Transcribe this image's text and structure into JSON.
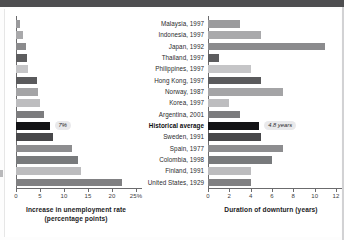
{
  "chart_data": [
    {
      "type": "bar",
      "orientation": "horizontal",
      "title": "",
      "xlabel": "Increase in unemployment rate (percentage points)",
      "ylabel": "",
      "xlim": [
        0,
        25
      ],
      "xticks": [
        0,
        5,
        10,
        15,
        20,
        25
      ],
      "xtick_labels": [
        "0",
        "5",
        "10",
        "15",
        "20",
        "25%"
      ],
      "grid": false,
      "categories": [
        "Malaysia, 1997",
        "Indonesia, 1997",
        "Japan, 1992",
        "Thailand, 1997",
        "Philippines, 1997",
        "Hong Kong, 1997",
        "Norway, 1987",
        "Korea, 1997",
        "Argentina, 2001",
        "Historical average",
        "Sweden, 1991",
        "Spain, 1977",
        "Colombia, 1998",
        "Finland, 1991",
        "United States, 1929"
      ],
      "values": [
        0.9,
        1.5,
        2.1,
        2.3,
        2.5,
        4.3,
        4.6,
        5.0,
        5.9,
        7.0,
        7.8,
        11.7,
        13.0,
        13.5,
        22.0
      ],
      "annotation": "7%",
      "annotation_index": 9
    },
    {
      "type": "bar",
      "orientation": "horizontal",
      "title": "",
      "xlabel": "Duration of downturn (years)",
      "ylabel": "",
      "xlim": [
        0,
        12
      ],
      "xticks": [
        0,
        2,
        4,
        6,
        8,
        10,
        12
      ],
      "xtick_labels": [
        "0",
        "2",
        "4",
        "6",
        "8",
        "10",
        "12"
      ],
      "grid": false,
      "categories": [
        "Malaysia, 1997",
        "Indonesia, 1997",
        "Japan, 1992",
        "Thailand, 1997",
        "Philippines, 1997",
        "Hong Kong, 1997",
        "Norway, 1987",
        "Korea, 1997",
        "Argentina, 2001",
        "Historical average",
        "Sweden, 1991",
        "Spain, 1977",
        "Colombia, 1998",
        "Finland, 1991",
        "United States, 1929"
      ],
      "values": [
        3.0,
        5.0,
        11.0,
        1.0,
        4.0,
        5.0,
        7.0,
        2.0,
        3.0,
        4.8,
        5.0,
        7.0,
        6.0,
        4.0,
        4.0
      ],
      "annotation": "4.8 years",
      "annotation_index": 9
    }
  ],
  "left_chart": {
    "axis_title_line1": "Increase in unemployment rate",
    "axis_title_line2": "(percentage points)",
    "tick_labels": [
      "0",
      "5",
      "10",
      "15",
      "20",
      "25%"
    ],
    "badge": "7%"
  },
  "right_chart": {
    "axis_title_line1": "Duration of downturn (years)",
    "axis_title_line2": "",
    "tick_labels": [
      "0",
      "2",
      "4",
      "6",
      "8",
      "10",
      "12"
    ],
    "badge": "4.8 years"
  },
  "categories": [
    {
      "label": "Malaysia, 1997",
      "highlight": false,
      "left": 0.9,
      "right": 3.0,
      "color": "#9b9b9d"
    },
    {
      "label": "Indonesia, 1997",
      "highlight": false,
      "left": 1.5,
      "right": 5.0,
      "color": "#a9a9ab"
    },
    {
      "label": "Japan, 1992",
      "highlight": false,
      "left": 2.1,
      "right": 11.0,
      "color": "#8b8b8d"
    },
    {
      "label": "Thailand, 1997",
      "highlight": false,
      "left": 2.3,
      "right": 1.0,
      "color": "#5d5d5f"
    },
    {
      "label": "Philippines, 1997",
      "highlight": false,
      "left": 2.5,
      "right": 4.0,
      "color": "#c5c5c7"
    },
    {
      "label": "Hong Kong, 1997",
      "highlight": false,
      "left": 4.3,
      "right": 5.0,
      "color": "#5a5a5c"
    },
    {
      "label": "Norway, 1987",
      "highlight": false,
      "left": 4.6,
      "right": 7.0,
      "color": "#a4a4a6"
    },
    {
      "label": "Korea, 1997",
      "highlight": false,
      "left": 5.0,
      "right": 2.0,
      "color": "#bdbdbf"
    },
    {
      "label": "Argentina, 2001",
      "highlight": false,
      "left": 5.9,
      "right": 3.0,
      "color": "#7c7c7e"
    },
    {
      "label": "Historical average",
      "highlight": true,
      "left": 7.0,
      "right": 4.8,
      "color": "#131315"
    },
    {
      "label": "Sweden, 1991",
      "highlight": false,
      "left": 7.8,
      "right": 5.0,
      "color": "#48484a"
    },
    {
      "label": "Spain, 1977",
      "highlight": false,
      "left": 11.7,
      "right": 7.0,
      "color": "#8d8d8f"
    },
    {
      "label": "Colombia, 1998",
      "highlight": false,
      "left": 13.0,
      "right": 6.0,
      "color": "#787a7c"
    },
    {
      "label": "Finland, 1991",
      "highlight": false,
      "left": 13.5,
      "right": 4.0,
      "color": "#bcbcbe"
    },
    {
      "label": "United States, 1929",
      "highlight": false,
      "left": 22.0,
      "right": 4.0,
      "color": "#808082"
    }
  ],
  "colors": {
    "banner": "#4e4e50",
    "axis": "#6b6b6d",
    "badge_bg": "#e9e9eb",
    "text": "#2b2b2d"
  }
}
